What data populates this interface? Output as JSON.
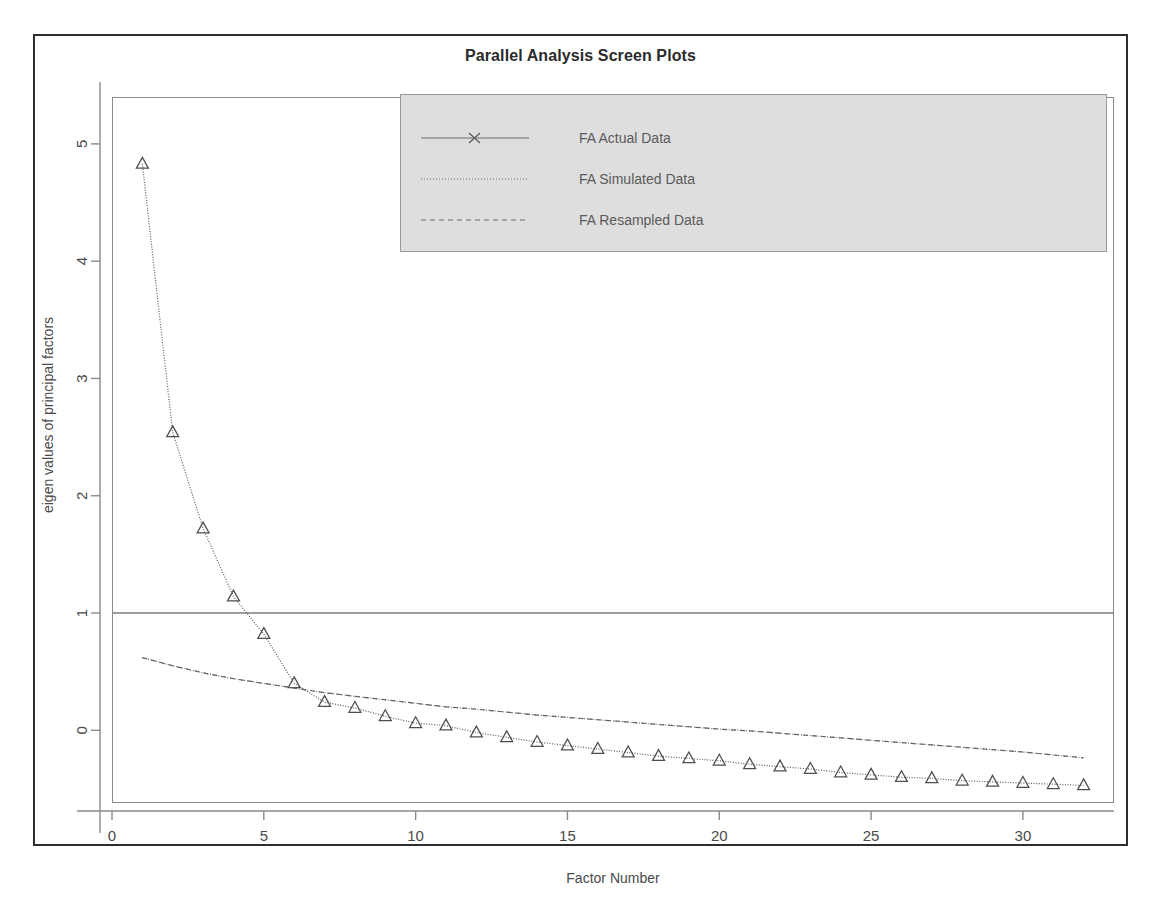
{
  "figure": {
    "title": "Parallel Analysis Screen Plots"
  },
  "legend": {
    "entries": [
      {
        "label": "FA  Actual Data",
        "key": "solid-with-x-marker"
      },
      {
        "label": "FA  Simulated Data",
        "key": "dotted-line"
      },
      {
        "label": "FA  Resampled Data",
        "key": "dashed-line"
      }
    ]
  },
  "axes": {
    "x_label": "Factor Number",
    "y_label": "eigen values of principal factors",
    "x_ticks": [
      "0",
      "5",
      "10",
      "15",
      "20",
      "25",
      "30"
    ],
    "y_ticks": [
      "0",
      "1",
      "2",
      "3",
      "4",
      "5"
    ]
  },
  "chart_data": {
    "type": "line",
    "title": "Parallel Analysis Screen Plots",
    "xlabel": "Factor Number",
    "ylabel": "eigen values of principal factors",
    "xlim": [
      0,
      33
    ],
    "ylim": [
      -0.62,
      5.4
    ],
    "xticks": [
      0,
      5,
      10,
      15,
      20,
      25,
      30
    ],
    "yticks": [
      0,
      1,
      2,
      3,
      4,
      5
    ],
    "grid": false,
    "legend_position": "top-center",
    "reference_lines": [
      {
        "axis": "y",
        "value": 1
      }
    ],
    "x": [
      1,
      2,
      3,
      4,
      5,
      6,
      7,
      8,
      9,
      10,
      11,
      12,
      13,
      14,
      15,
      16,
      17,
      18,
      19,
      20,
      21,
      22,
      23,
      24,
      25,
      26,
      27,
      28,
      29,
      30,
      31,
      32
    ],
    "series": [
      {
        "name": "FA  Actual Data",
        "marker": "triangle",
        "linestyle": "solid",
        "values": [
          4.83,
          2.54,
          1.72,
          1.14,
          0.82,
          0.4,
          0.24,
          0.19,
          0.12,
          0.06,
          0.04,
          -0.02,
          -0.06,
          -0.1,
          -0.13,
          -0.16,
          -0.19,
          -0.22,
          -0.24,
          -0.26,
          -0.29,
          -0.31,
          -0.33,
          -0.36,
          -0.38,
          -0.4,
          -0.41,
          -0.43,
          -0.44,
          -0.45,
          -0.46,
          -0.47
        ]
      },
      {
        "name": "FA  Simulated Data",
        "marker": "none",
        "linestyle": "dotted",
        "values": [
          0.62,
          0.55,
          0.49,
          0.44,
          0.4,
          0.36,
          0.32,
          0.29,
          0.26,
          0.23,
          0.2,
          0.18,
          0.155,
          0.13,
          0.11,
          0.09,
          0.07,
          0.05,
          0.03,
          0.01,
          -0.005,
          -0.025,
          -0.045,
          -0.065,
          -0.085,
          -0.105,
          -0.125,
          -0.145,
          -0.165,
          -0.185,
          -0.21,
          -0.235
        ]
      },
      {
        "name": "FA  Resampled Data",
        "marker": "none",
        "linestyle": "dashed",
        "values": [
          0.62,
          0.55,
          0.49,
          0.44,
          0.4,
          0.36,
          0.32,
          0.29,
          0.26,
          0.23,
          0.2,
          0.18,
          0.155,
          0.13,
          0.11,
          0.09,
          0.07,
          0.05,
          0.03,
          0.01,
          -0.005,
          -0.025,
          -0.045,
          -0.065,
          -0.085,
          -0.105,
          -0.125,
          -0.145,
          -0.165,
          -0.185,
          -0.21,
          -0.235
        ]
      }
    ]
  }
}
